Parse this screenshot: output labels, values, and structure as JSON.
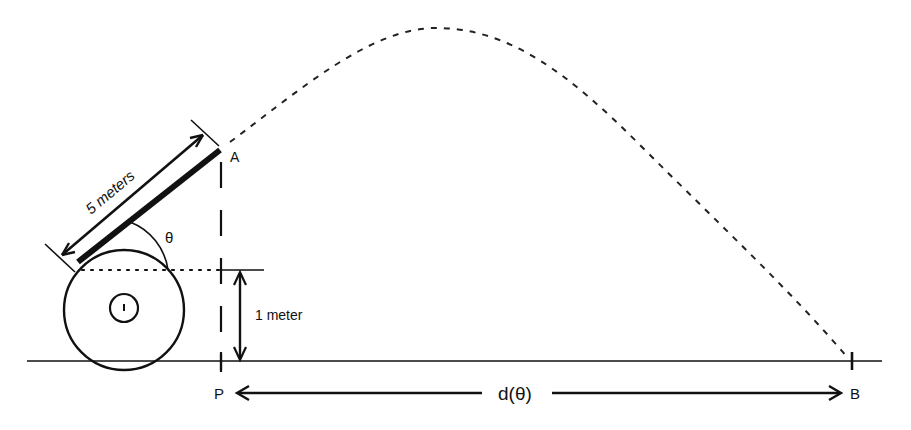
{
  "diagram": {
    "labels": {
      "length": "5  meters",
      "angle": "θ",
      "height": "1  meter",
      "point_a": "A",
      "point_p": "P",
      "point_b": "B",
      "distance": "d(θ)"
    },
    "colors": {
      "ink": "#111111",
      "background": "#ffffff"
    }
  }
}
